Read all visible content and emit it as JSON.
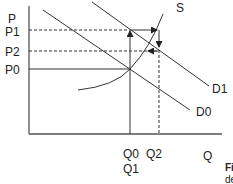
{
  "diagram": {
    "axes": {
      "y_label": "P",
      "x_label": "Q"
    },
    "price_labels": {
      "p1": "P1",
      "p2": "P2",
      "p0": "P0"
    },
    "quantity_labels": {
      "q0": "Q0",
      "q1": "Q1",
      "q2": "Q2"
    },
    "curves": {
      "supply": "S",
      "demand_new": "D1",
      "demand_old": "D0"
    },
    "caption": {
      "fig": "Fi",
      "rest": "de"
    }
  }
}
